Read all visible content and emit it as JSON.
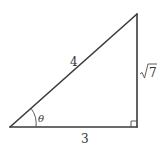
{
  "diagram": {
    "type": "right-triangle",
    "labels": {
      "hypotenuse": "4",
      "adjacent": "3",
      "opposite": "√7",
      "opposite_radicand": "7",
      "angle": "θ"
    },
    "right_angle_marker": true,
    "colors": {
      "stroke": "#3a3a3a",
      "text": "#333333",
      "background": "#ffffff"
    }
  }
}
